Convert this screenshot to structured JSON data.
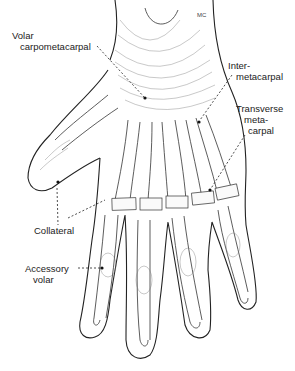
{
  "figure": {
    "signature": "MC",
    "labels": [
      {
        "id": "volar-carpometacarpal",
        "lines": [
          "Volar",
          "carpometacarpal"
        ]
      },
      {
        "id": "intermetacarpal",
        "lines": [
          "Inter-",
          "metacarpal"
        ]
      },
      {
        "id": "transverse-metacarpal",
        "lines": [
          "Transverse",
          "meta-",
          "carpal"
        ]
      },
      {
        "id": "collateral",
        "lines": [
          "Collateral"
        ]
      },
      {
        "id": "accessory-volar",
        "lines": [
          "Accessory",
          "volar"
        ]
      }
    ]
  }
}
